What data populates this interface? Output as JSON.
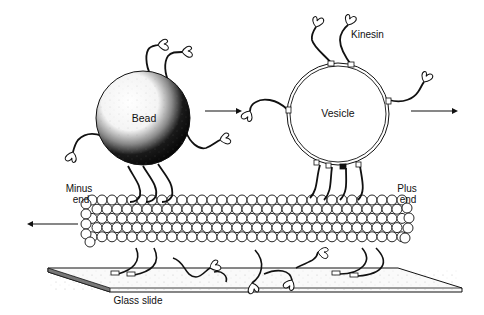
{
  "diagram": {
    "labels": {
      "bead": "Bead",
      "vesicle": "Vesicle",
      "kinesin": "Kinesin",
      "minus_end_line1": "Minus",
      "minus_end_line2": "end",
      "plus_end_line1": "Plus",
      "plus_end_line2": "end",
      "glass_slide": "Glass slide"
    },
    "arrows": [
      {
        "id": "bead-to-vesicle",
        "direction": "right"
      },
      {
        "id": "vesicle-motion",
        "direction": "right"
      },
      {
        "id": "microtubule-motion",
        "direction": "left"
      }
    ],
    "colors": {
      "ink": "#111111",
      "background": "#ffffff",
      "tubulin_fill": "#ffffff",
      "bead_dark": "#0d0d0d"
    }
  }
}
